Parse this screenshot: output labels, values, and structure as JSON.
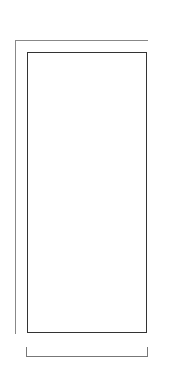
{
  "chart": {
    "columns": 11,
    "rows": 24,
    "colors": {
      "light": "#f0f0f0",
      "dark": "#606060",
      "border": "#333333"
    },
    "grid_top_to_bottom": [
      [
        0,
        0,
        0,
        0,
        0,
        0,
        0,
        0,
        0,
        0,
        0
      ],
      [
        0,
        0,
        0,
        1,
        1,
        0,
        1,
        1,
        0,
        0,
        0
      ],
      [
        0,
        0,
        1,
        1,
        0,
        1,
        1,
        1,
        1,
        0,
        0
      ],
      [
        0,
        0,
        0,
        1,
        1,
        1,
        0,
        1,
        0,
        0,
        0
      ],
      [
        0,
        0,
        0,
        1,
        1,
        0,
        0,
        1,
        0,
        0,
        0
      ],
      [
        0,
        0,
        1,
        1,
        0,
        0,
        0,
        0,
        1,
        0,
        0
      ],
      [
        0,
        0,
        1,
        0,
        0,
        0,
        0,
        0,
        1,
        0,
        0
      ],
      [
        0,
        0,
        1,
        0,
        0,
        0,
        0,
        0,
        1,
        0,
        0
      ],
      [
        0,
        0,
        1,
        0,
        0,
        0,
        0,
        0,
        1,
        0,
        0
      ],
      [
        0,
        0,
        0,
        1,
        1,
        1,
        1,
        1,
        0,
        0,
        0
      ],
      [
        0,
        0,
        1,
        1,
        0,
        1,
        0,
        1,
        1,
        0,
        0
      ],
      [
        0,
        0,
        0,
        0,
        0,
        1,
        0,
        0,
        0,
        0,
        0
      ],
      [
        0,
        1,
        1,
        0,
        0,
        1,
        0,
        0,
        1,
        1,
        0
      ],
      [
        0,
        1,
        1,
        1,
        0,
        1,
        0,
        1,
        1,
        1,
        0
      ],
      [
        0,
        0,
        1,
        1,
        0,
        1,
        0,
        1,
        1,
        0,
        0
      ],
      [
        0,
        0,
        0,
        0,
        1,
        1,
        1,
        0,
        0,
        0,
        0
      ],
      [
        0,
        1,
        0,
        0,
        0,
        1,
        0,
        0,
        0,
        1,
        0
      ],
      [
        0,
        1,
        1,
        0,
        0,
        1,
        0,
        0,
        1,
        1,
        0
      ],
      [
        0,
        1,
        1,
        1,
        0,
        1,
        0,
        1,
        1,
        1,
        0
      ],
      [
        0,
        0,
        1,
        1,
        0,
        1,
        0,
        1,
        1,
        0,
        0
      ],
      [
        0,
        0,
        0,
        0,
        1,
        1,
        1,
        0,
        0,
        0,
        0
      ],
      [
        0,
        0,
        0,
        0,
        0,
        1,
        0,
        0,
        0,
        0,
        0
      ],
      [
        0,
        0,
        0,
        0,
        0,
        1,
        0,
        0,
        0,
        0,
        0
      ],
      [
        0,
        0,
        0,
        0,
        0,
        0,
        0,
        0,
        0,
        0,
        0
      ]
    ],
    "row_labels": [
      {
        "label": "23",
        "row": 23
      },
      {
        "label": "21",
        "row": 21
      },
      {
        "label": "19",
        "row": 19
      },
      {
        "label": "17",
        "row": 17
      },
      {
        "label": "15",
        "row": 15
      },
      {
        "label": "13",
        "row": 13
      },
      {
        "label": "11",
        "row": 11
      },
      {
        "label": "9",
        "row": 9
      },
      {
        "label": "7",
        "row": 7
      },
      {
        "label": "5",
        "row": 5
      },
      {
        "label": "3",
        "row": 3
      },
      {
        "label": "1",
        "row": 1
      }
    ],
    "repeat_label": "10-st rep"
  }
}
